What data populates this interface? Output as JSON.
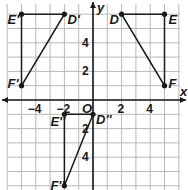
{
  "diagram": {
    "type": "coordinate-plane",
    "axes": {
      "x_label": "x",
      "y_label": "y",
      "origin_label": "O",
      "x_ticks": [
        {
          "value": -4,
          "label": "−4"
        },
        {
          "value": -2,
          "label": "−2"
        },
        {
          "value": 2,
          "label": "2"
        },
        {
          "value": 4,
          "label": "4"
        }
      ],
      "y_ticks": [
        {
          "value": 4,
          "label": "4"
        },
        {
          "value": 2,
          "label": "2"
        },
        {
          "value": -2,
          "label": "2"
        },
        {
          "value": -4,
          "label": "4"
        }
      ]
    },
    "colors": {
      "grid": "#b8b8b8",
      "axis": "#1a1a1a",
      "shape": "#1a1a1a",
      "background": "#ffffff"
    },
    "triangles": [
      {
        "name": "DEF",
        "points": [
          {
            "label": "D",
            "x": 2,
            "y": 6
          },
          {
            "label": "E",
            "x": 5,
            "y": 6
          },
          {
            "label": "F",
            "x": 5,
            "y": 1
          }
        ]
      },
      {
        "name": "D'E'F'",
        "points": [
          {
            "label": "D'",
            "x": -2,
            "y": 6
          },
          {
            "label": "E'",
            "x": -5,
            "y": 6
          },
          {
            "label": "F'",
            "x": -5,
            "y": 1
          }
        ]
      },
      {
        "name": "D''E''F''",
        "points": [
          {
            "label": "D''",
            "x": 0,
            "y": -1
          },
          {
            "label": "E''",
            "x": -2,
            "y": -1
          },
          {
            "label": "F''",
            "x": -2,
            "y": -6
          }
        ]
      }
    ]
  }
}
